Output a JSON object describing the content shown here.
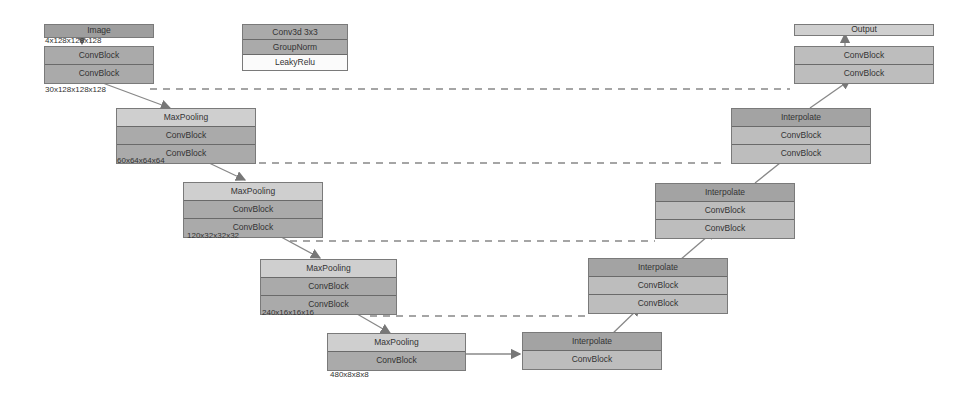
{
  "legend": {
    "rows": [
      "Conv3d 3x3",
      "GroupNorm",
      "LeakyRelu"
    ]
  },
  "input": {
    "label": "Image",
    "dim": "4x128x128x128"
  },
  "output": {
    "label": "Output"
  },
  "encoder": [
    {
      "rows": [
        "ConvBlock",
        "ConvBlock"
      ],
      "dim": "30x128x128x128"
    },
    {
      "rows": [
        "MaxPooling",
        "ConvBlock",
        "ConvBlock"
      ],
      "dim": "60x64x64x64"
    },
    {
      "rows": [
        "MaxPooling",
        "ConvBlock",
        "ConvBlock"
      ],
      "dim": "120x32x32x32"
    },
    {
      "rows": [
        "MaxPooling",
        "ConvBlock",
        "ConvBlock"
      ],
      "dim": "240x16x16x16"
    },
    {
      "rows": [
        "MaxPooling",
        "ConvBlock"
      ],
      "dim": "480x8x8x8"
    }
  ],
  "decoder": [
    {
      "rows": [
        "Interpolate",
        "ConvBlock"
      ]
    },
    {
      "rows": [
        "Interpolate",
        "ConvBlock",
        "ConvBlock"
      ]
    },
    {
      "rows": [
        "Interpolate",
        "ConvBlock",
        "ConvBlock"
      ]
    },
    {
      "rows": [
        "Interpolate",
        "ConvBlock",
        "ConvBlock"
      ]
    },
    {
      "rows": [
        "ConvBlock",
        "ConvBlock"
      ]
    }
  ]
}
